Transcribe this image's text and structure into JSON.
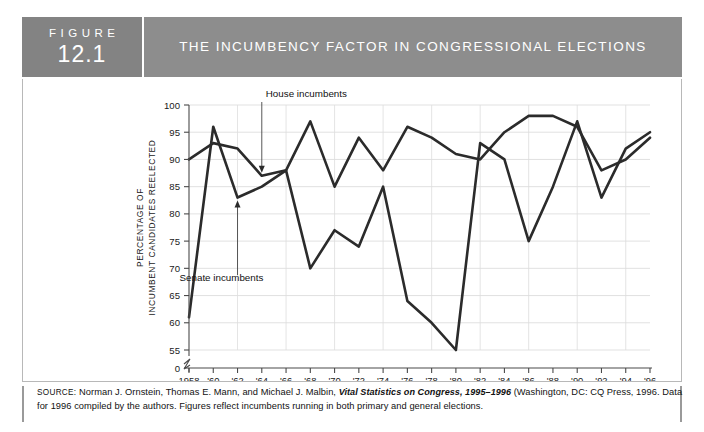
{
  "header": {
    "figure_word": "FIGURE",
    "figure_number": "12.1",
    "title": "THE INCUMBENCY FACTOR IN CONGRESSIONAL ELECTIONS"
  },
  "source": {
    "label": "SOURCE:",
    "line1_a": " Norman J. Ornstein, Thomas E. Mann, and Michael J. Malbin, ",
    "line1_italic": "Vital Statistics on Congress, 1995–1996",
    "line1_b": " (Washington, DC: CQ Press, 1996. Data",
    "line2": "for 1996 compiled by the authors. Figures reflect incumbents running in both primary and general elections."
  },
  "chart_data": {
    "type": "line",
    "title": "THE INCUMBENCY FACTOR IN CONGRESSIONAL ELECTIONS",
    "xlabel": "ELECTION YEAR",
    "ylabel": "PERCENTAGE OF INCUMBENT CANDIDATES REELECTED",
    "ylabel_line1": "PERCENTAGE OF",
    "ylabel_line2": "INCUMBENT CANDIDATES REELECTED",
    "grid": true,
    "legend_position": "inline-annotations",
    "axis_break": true,
    "ylim": [
      55,
      100
    ],
    "yticks": [
      100,
      95,
      90,
      85,
      80,
      75,
      70,
      65,
      60,
      55,
      0
    ],
    "ytick_labels": [
      "100",
      "95",
      "90",
      "85",
      "80",
      "75",
      "70",
      "65",
      "60",
      "55",
      "0"
    ],
    "x": [
      1958,
      1960,
      1962,
      1964,
      1966,
      1968,
      1970,
      1972,
      1974,
      1976,
      1978,
      1980,
      1982,
      1984,
      1986,
      1988,
      1990,
      1992,
      1994,
      1996
    ],
    "xtick_labels": [
      "1958",
      "'60",
      "'62",
      "'64",
      "'66",
      "'68",
      "'70",
      "'72",
      "'74",
      "'76",
      "'78",
      "'80",
      "'82",
      "'84",
      "'86",
      "'88",
      "'90",
      "'92",
      "'94",
      "'96"
    ],
    "series": [
      {
        "name": "House incumbents",
        "annotation": "House incumbents",
        "values": [
          90,
          93,
          92,
          87,
          88,
          97,
          85,
          94,
          88,
          96,
          94,
          91,
          90,
          95,
          98,
          98,
          96,
          88,
          90,
          94
        ]
      },
      {
        "name": "Senate incumbents",
        "annotation": "Senate incumbents",
        "values": [
          61,
          96,
          83,
          85,
          88,
          70,
          77,
          74,
          85,
          64,
          60,
          55,
          93,
          90,
          75,
          85,
          97,
          83,
          92,
          95
        ]
      }
    ],
    "annotations": [
      {
        "text": "House incumbents",
        "target_year": 1964,
        "target_series": "House incumbents"
      },
      {
        "text": "Senate incumbents",
        "target_year": 1962,
        "target_series": "Senate incumbents"
      }
    ],
    "line_color": "#2b2b2b"
  }
}
